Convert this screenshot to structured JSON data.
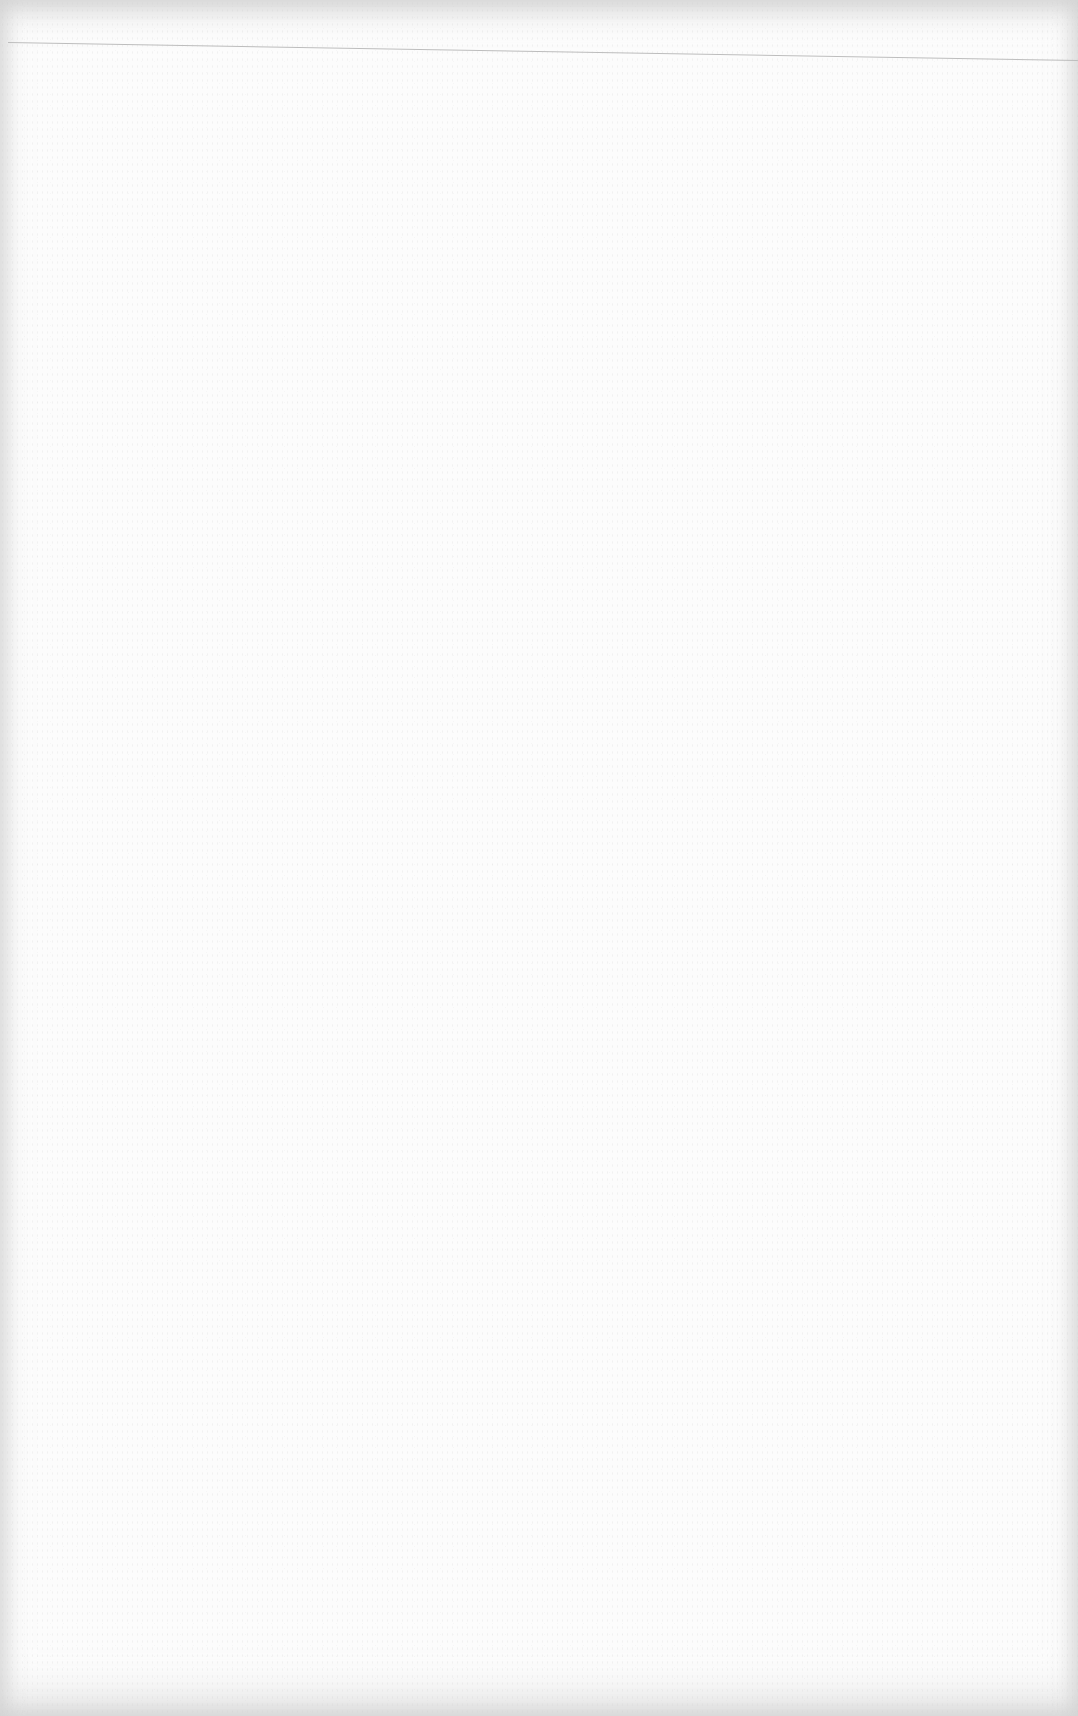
{
  "page": {
    "type": "blank-scanned-page",
    "background_color": "#fcfcfc",
    "edge_shade_color": "#d2d2d2"
  },
  "rule": {
    "color": "#bdbdbd",
    "start": [
      8,
      42
    ],
    "end": [
      1078,
      60
    ]
  }
}
